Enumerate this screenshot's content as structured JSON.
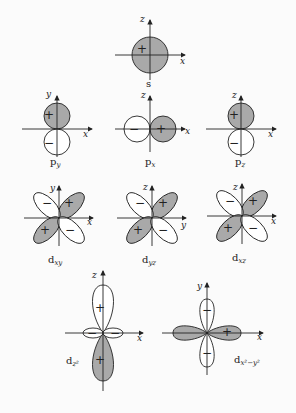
{
  "colors": {
    "filled": "#a9a9a9",
    "empty": "#ffffff",
    "stroke": "#222222",
    "background": "#fbfbfb"
  },
  "orbitals": [
    {
      "id": "s",
      "label": "s",
      "sub": "",
      "axes": [
        "z",
        "x"
      ],
      "signs": [
        "+"
      ]
    },
    {
      "id": "py",
      "label": "p",
      "sub": "y",
      "axes": [
        "y",
        "x"
      ],
      "signs": [
        "+",
        "−"
      ]
    },
    {
      "id": "px",
      "label": "p",
      "sub": "x",
      "axes": [
        "z",
        "x"
      ],
      "signs": [
        "−",
        "+"
      ]
    },
    {
      "id": "pz",
      "label": "p",
      "sub": "z",
      "axes": [
        "z",
        "x"
      ],
      "signs": [
        "+",
        "−"
      ]
    },
    {
      "id": "dxy",
      "label": "d",
      "sub": "xy",
      "axes": [
        "y",
        "x"
      ],
      "signs": [
        "+",
        "−",
        "+",
        "−"
      ]
    },
    {
      "id": "dyz",
      "label": "d",
      "sub": "yz",
      "axes": [
        "z",
        "y"
      ],
      "signs": [
        "+",
        "−",
        "+",
        "−"
      ]
    },
    {
      "id": "dxz",
      "label": "d",
      "sub": "xz",
      "axes": [
        "z",
        "x"
      ],
      "signs": [
        "+",
        "−",
        "+",
        "−"
      ]
    },
    {
      "id": "dz2",
      "label": "d",
      "sub": "z²",
      "axes": [
        "z",
        "x"
      ],
      "signs": [
        "+",
        "−",
        "−",
        "+"
      ]
    },
    {
      "id": "dx2y2",
      "label": "d",
      "sub": "x²−y²",
      "axes": [
        "y",
        "x"
      ],
      "signs": [
        "−",
        "+",
        "−"
      ]
    }
  ]
}
